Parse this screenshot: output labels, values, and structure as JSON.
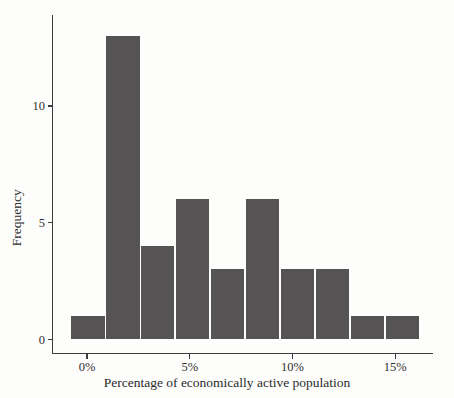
{
  "chart_data": {
    "type": "bar",
    "subtype": "histogram",
    "title": "",
    "xlabel": "Percentage of economically active population",
    "ylabel": "Frequency",
    "values": [
      1,
      13,
      4,
      6,
      3,
      6,
      3,
      3,
      1,
      1
    ],
    "bin_edges_percent": [
      -0.8,
      0.9,
      2.6,
      4.3,
      6.0,
      7.7,
      9.4,
      11.1,
      12.8,
      14.5,
      16.2
    ],
    "x_tick_labels": [
      "0%",
      "5%",
      "10%",
      "15%"
    ],
    "x_tick_values": [
      0,
      5,
      10,
      15
    ],
    "y_tick_labels": [
      "0",
      "5",
      "10"
    ],
    "y_tick_values": [
      0,
      5,
      10
    ],
    "xlim": [
      -1.7,
      16.9
    ],
    "ylim": [
      0,
      13.7
    ],
    "grid": "off",
    "legend": "none",
    "bar_color": "#555353",
    "separator_color": "#fdfdfb",
    "axis_color": "#3d3d3d",
    "text_color": "#2f2f2f",
    "background_color": "#fdfdfb"
  }
}
